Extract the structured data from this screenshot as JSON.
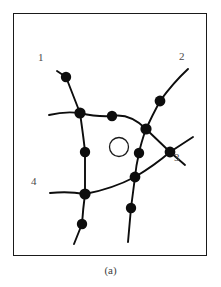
{
  "figure": {
    "caption": "(a)",
    "frame": {
      "x": 13,
      "y": 13,
      "width": 194,
      "height": 243,
      "border_color": "#1a1a1a"
    },
    "stroke_color": "#0d0d0d",
    "node_color": "#0d0d0d",
    "background_color": "#ffffff",
    "label_color": "#4a4a4a"
  },
  "chart_data": {
    "type": "diagram",
    "title": "(a)",
    "endpoint_labels": [
      {
        "id": "1",
        "text": "1",
        "x": 38,
        "y": 52
      },
      {
        "id": "2",
        "text": "2",
        "x": 179,
        "y": 51
      },
      {
        "id": "3",
        "text": "3",
        "x": 174,
        "y": 152
      },
      {
        "id": "4",
        "text": "4",
        "x": 31,
        "y": 176
      }
    ],
    "nodes": [
      {
        "id": "n1",
        "x": 53,
        "y": 64,
        "r": 5.2
      },
      {
        "id": "n2",
        "x": 67,
        "y": 100,
        "r": 5.6
      },
      {
        "id": "n3",
        "x": 99,
        "y": 103,
        "r": 5.2
      },
      {
        "id": "n4",
        "x": 147,
        "y": 88,
        "r": 5.4
      },
      {
        "id": "n5",
        "x": 133,
        "y": 116,
        "r": 5.6
      },
      {
        "id": "n6",
        "x": 126,
        "y": 140,
        "r": 5.2
      },
      {
        "id": "n7",
        "x": 157,
        "y": 139,
        "r": 5.4
      },
      {
        "id": "n8",
        "x": 72,
        "y": 139,
        "r": 5.2
      },
      {
        "id": "n9",
        "x": 122,
        "y": 164,
        "r": 5.4
      },
      {
        "id": "n10",
        "x": 72,
        "y": 181,
        "r": 5.6
      },
      {
        "id": "n11",
        "x": 118,
        "y": 195,
        "r": 5.2
      },
      {
        "id": "n12",
        "x": 69,
        "y": 211,
        "r": 5.2
      }
    ],
    "center_circle": {
      "x": 106,
      "y": 134,
      "r": 9.5
    },
    "strands": [
      {
        "id": "strand-1",
        "label": "1",
        "d": "M 44 58 L 53 64 L 67 100 Q 71 128 72 139 Q 72 166 72 181 Q 70 196 69 211 L 61 231"
      },
      {
        "id": "strand-2",
        "label": "2",
        "d": "M 175 56 Q 160 70 147 88 Q 139 103 133 116 Q 128 130 126 140 Q 123 153 122 164 Q 120 180 118 195 L 115 229"
      },
      {
        "id": "strand-3",
        "label": "3",
        "d": "M 133 116 L 157 139 L 172 152"
      },
      {
        "id": "strand-3b",
        "label": "3",
        "d": "M 157 139 L 180 124"
      },
      {
        "id": "arc-top",
        "label": "top-arc",
        "d": "M 36 102 Q 52 98 67 100 Q 84 104 99 103 Q 117 100 133 116"
      },
      {
        "id": "arc-bottom",
        "label": "bottom-arc",
        "d": "M 37 180 Q 55 178 72 181 Q 99 176 122 164 Q 142 152 157 139"
      }
    ],
    "axis_visible": false,
    "grid": false,
    "legend": null
  }
}
